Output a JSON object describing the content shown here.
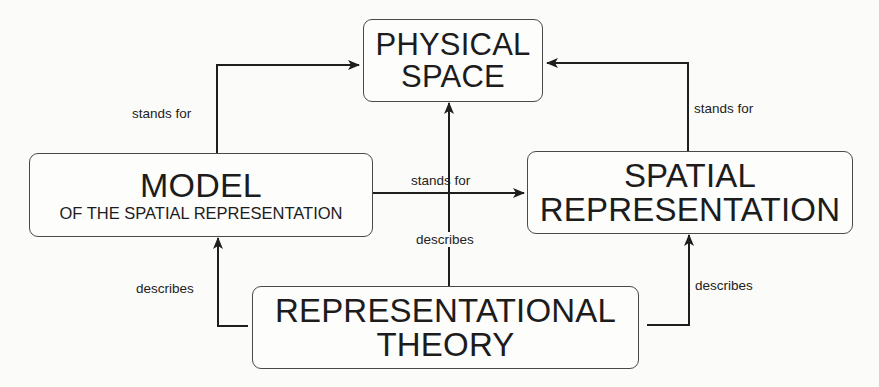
{
  "diagram": {
    "nodes": [
      {
        "id": "physical",
        "lines": [
          "PHYSICAL",
          "SPACE"
        ]
      },
      {
        "id": "model",
        "title": "MODEL",
        "subtitle": "OF THE SPATIAL REPRESENTATION"
      },
      {
        "id": "spatial",
        "lines": [
          "SPATIAL",
          "REPRESENTATION"
        ]
      },
      {
        "id": "theory",
        "lines": [
          "REPRESENTATIONAL",
          "THEORY"
        ]
      }
    ],
    "edges": [
      {
        "from": "model",
        "to": "physical",
        "label": "stands for"
      },
      {
        "from": "spatial",
        "to": "physical",
        "label": "stands for"
      },
      {
        "from": "model",
        "to": "spatial",
        "label": "stands for"
      },
      {
        "from": "theory",
        "to": "physical",
        "label": "describes"
      },
      {
        "from": "theory",
        "to": "model",
        "label": "describes"
      },
      {
        "from": "theory",
        "to": "spatial",
        "label": "describes"
      }
    ]
  },
  "nodes": {
    "physical": {
      "line1": "PHYSICAL",
      "line2": "SPACE"
    },
    "model": {
      "title": "MODEL",
      "subtitle": "OF THE SPATIAL REPRESENTATION"
    },
    "spatial": {
      "line1": "SPATIAL",
      "line2": "REPRESENTATION"
    },
    "theory": {
      "line1": "REPRESENTATIONAL",
      "line2": "THEORY"
    }
  },
  "labels": {
    "model_to_physical": "stands for",
    "spatial_to_physical": "stands for",
    "model_to_spatial": "stands for",
    "theory_to_physical": "describes",
    "theory_to_model": "describes",
    "theory_to_spatial": "describes"
  },
  "colors": {
    "line": "#1e1e1e",
    "box_border": "#4a4a4a",
    "background": "#fbfbf9"
  }
}
